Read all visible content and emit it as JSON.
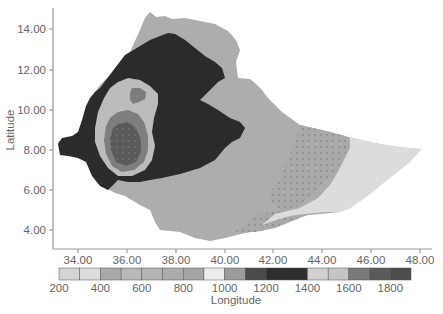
{
  "chart_data": {
    "type": "heatmap",
    "subtype": "filled contour map (geographic)",
    "title": "",
    "xlabel": "Longitude",
    "ylabel": "Latitude",
    "xlim": [
      33.0,
      48.5
    ],
    "ylim": [
      3.0,
      15.0
    ],
    "x_ticks": [
      "34.00",
      "36.00",
      "38.00",
      "40.00",
      "42.00",
      "44.00",
      "46.00",
      "48.00"
    ],
    "y_ticks": [
      "14.00",
      "12.00",
      "10.00",
      "8.00",
      "6.00",
      "4.00"
    ],
    "grid": false,
    "legend_position": "bottom colorbar",
    "colorbar": {
      "tick_labels": [
        "200",
        "400",
        "600",
        "800",
        "1000",
        "1200",
        "1400",
        "1600",
        "1800"
      ],
      "range": [
        200,
        1900
      ],
      "segments": [
        {
          "from": 200,
          "to": 300,
          "color": "#d4d4d4"
        },
        {
          "from": 300,
          "to": 400,
          "color": "#dcdcdc"
        },
        {
          "from": 400,
          "to": 500,
          "color": "#a8a8a8"
        },
        {
          "from": 500,
          "to": 600,
          "color": "#b8b8b8"
        },
        {
          "from": 600,
          "to": 700,
          "color": "#b4b4b4"
        },
        {
          "from": 700,
          "to": 800,
          "color": "#acacac"
        },
        {
          "from": 800,
          "to": 900,
          "color": "#a4a4a4"
        },
        {
          "from": 900,
          "to": 1000,
          "color": "#ececec"
        },
        {
          "from": 1000,
          "to": 1100,
          "color": "#9c9c9c"
        },
        {
          "from": 1100,
          "to": 1200,
          "color": "#4a4a4a"
        },
        {
          "from": 1200,
          "to": 1400,
          "color": "#2e2e2e"
        },
        {
          "from": 1400,
          "to": 1500,
          "color": "#d0d0d0"
        },
        {
          "from": 1500,
          "to": 1600,
          "color": "#c4c4c4"
        },
        {
          "from": 1600,
          "to": 1700,
          "color": "#7a7a7a"
        },
        {
          "from": 1700,
          "to": 1800,
          "color": "#5a5a5a"
        },
        {
          "from": 1800,
          "to": 1900,
          "color": "#4c4c4c"
        }
      ]
    },
    "regions": [
      {
        "name": "central-east highlands & lowlands",
        "value_range": "1000-1100",
        "color": "#acacac"
      },
      {
        "name": "western highlands belt",
        "value_range": "1200-1400",
        "color": "#2b2b2b"
      },
      {
        "name": "southwest ring",
        "value_range": "1500-1600",
        "color": "#bdbdbd"
      },
      {
        "name": "southwest inner zone",
        "value_range": "1600-1700",
        "color": "#7e7e7e"
      },
      {
        "name": "southwest core",
        "value_range": "1700-1900",
        "color": "#5c5c5c"
      },
      {
        "name": "southeast dotted zone",
        "value_range": "800-900",
        "color": "#a6a6a6"
      },
      {
        "name": "far east / Ogaden tip",
        "value_range": "200-400",
        "color": "#dadada"
      }
    ]
  },
  "axes": {
    "x_title": "Longitude",
    "y_title": "Latitude"
  }
}
